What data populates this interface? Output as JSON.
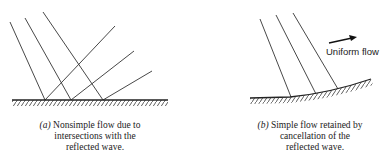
{
  "panel_a": {
    "caption_letter": "(a)",
    "caption_lines": [
      "Nonsimple flow due to",
      "intersections with the",
      "reflected wave."
    ]
  },
  "panel_b": {
    "caption_letter": "(b)",
    "caption_lines": [
      "Simple flow retained by",
      "cancellation of the",
      "reflected wave."
    ],
    "flow_label": "Uniform flow"
  },
  "colors": {
    "line": "#333333",
    "text": "#222222"
  }
}
